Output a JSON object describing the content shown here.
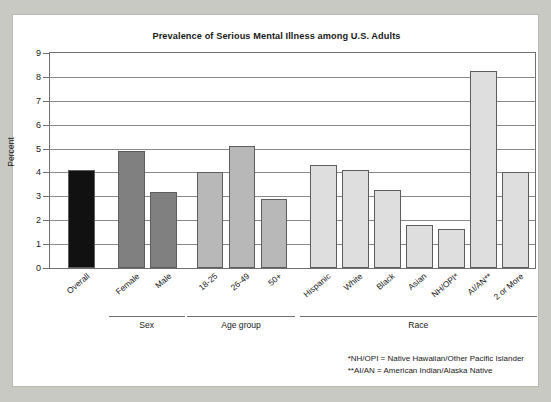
{
  "card": {
    "title": "Prevalence of Serious Mental Illness among U.S. Adults"
  },
  "chart_data": {
    "type": "bar",
    "title": "Prevalence of Serious Mental Illness among U.S. Adults",
    "xlabel": "",
    "ylabel": "Percent",
    "ylim": [
      0,
      9
    ],
    "yticks": [
      0,
      1,
      2,
      3,
      4,
      5,
      6,
      7,
      8,
      9
    ],
    "ytick_labels": [
      "0",
      "1",
      "2",
      "3",
      "4",
      "5",
      "6",
      "7",
      "8",
      "9"
    ],
    "grid": true,
    "legend": "none",
    "categories": [
      "Overall",
      "Female",
      "Male",
      "18-25",
      "26-49",
      "50+",
      "Hispanic",
      "White",
      "Black",
      "Asian",
      "NH/OPI*",
      "AI/AN**",
      "2 or More"
    ],
    "values": [
      4.1,
      4.9,
      3.2,
      4.0,
      5.1,
      2.9,
      4.3,
      4.1,
      3.25,
      1.8,
      1.65,
      8.25,
      4.0
    ],
    "bar_colors": [
      "#111111",
      "#808080",
      "#808080",
      "#b8b8b8",
      "#b8b8b8",
      "#b8b8b8",
      "#dedede",
      "#dedede",
      "#dedede",
      "#dedede",
      "#dedede",
      "#dedede",
      "#dedede"
    ],
    "groups": [
      {
        "label": "Sex",
        "start": 1,
        "end": 2
      },
      {
        "label": "Age group",
        "start": 3,
        "end": 5
      },
      {
        "label": "Race",
        "start": 6,
        "end": 12
      }
    ],
    "annotations": [
      "*NH/OPI = Native Hawaiian/Other Pacific Islander",
      "**AI/AN = American Indian/Alaska Native"
    ]
  }
}
